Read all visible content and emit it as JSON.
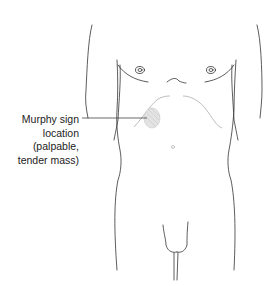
{
  "figure": {
    "annotation": {
      "lines": [
        "Murphy sign",
        "location",
        "(palpable,",
        "tender mass)"
      ]
    },
    "colors": {
      "outline": "#333333",
      "costal_margin": "#b5b5b5",
      "mass_fill": "#e3e3e3",
      "text": "#222222"
    }
  }
}
